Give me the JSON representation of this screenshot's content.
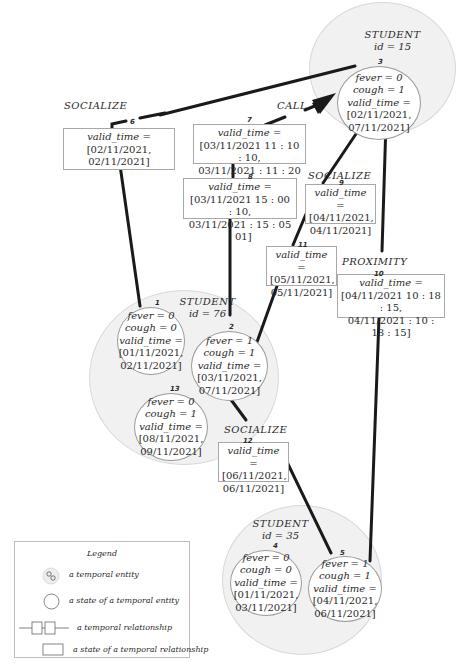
{
  "entities": [
    {
      "id": "e15",
      "type": "STUDENT",
      "id_label": "id = 15"
    },
    {
      "id": "e76",
      "type": "STUDENT",
      "id_label": "id = 76"
    },
    {
      "id": "e35",
      "type": "STUDENT",
      "id_label": "id = 35"
    }
  ],
  "states": [
    {
      "num": "3",
      "fever": "fever = 0",
      "cough": "cough = 1",
      "vt": "valid_time =",
      "from": "[02/11/2021,",
      "to": "07/11/2021]"
    },
    {
      "num": "1",
      "fever": "fever = 0",
      "cough": "cough = 0",
      "vt": "valid_time =",
      "from": "[01/11/2021,",
      "to": "02/11/2021]"
    },
    {
      "num": "2",
      "fever": "fever = 1",
      "cough": "cough = 1",
      "vt": "valid_time =",
      "from": "[03/11/2021,",
      "to": "07/11/2021]"
    },
    {
      "num": "13",
      "fever": "fever = 0",
      "cough": "cough = 1",
      "vt": "valid_time =",
      "from": "[08/11/2021,",
      "to": "09/11/2021]"
    },
    {
      "num": "4",
      "fever": "fever = 0",
      "cough": "cough = 0",
      "vt": "valid_time =",
      "from": "[01/11/2021,",
      "to": "03/11/2021]"
    },
    {
      "num": "5",
      "fever": "fever = 1",
      "cough": "cough = 1",
      "vt": "valid_time =",
      "from": "[04/11/2021,",
      "to": "06/11/2021]"
    }
  ],
  "relationships": [
    {
      "num": "6",
      "label": "SOCIALIZE",
      "vt": "valid_time =",
      "from": "[02/11/2021,",
      "to": "02/11/2021]"
    },
    {
      "num": "7",
      "label": "CALL",
      "vt": "valid_time =",
      "from": "[03/11/2021 11 : 10 : 10,",
      "to": "03/11/2021 : 11 : 20 : 01]"
    },
    {
      "num": "8",
      "label": "",
      "vt": "valid_time =",
      "from": "[03/11/2021 15 : 00 : 10,",
      "to": "03/11/2021 : 15 : 05 : 01]"
    },
    {
      "num": "9",
      "label": "SOCIALIZE",
      "vt": "valid_time =",
      "from": "[04/11/2021,",
      "to": "04/11/2021]"
    },
    {
      "num": "11",
      "label": "",
      "vt": "valid_time =",
      "from": "[05/11/2021,",
      "to": "05/11/2021]"
    },
    {
      "num": "10",
      "label": "PROXIMITY",
      "vt": "valid_time =",
      "from": "[04/11/2021 10 : 18 : 15,",
      "to": "04/11/2021 : 10 : 18 : 15]"
    },
    {
      "num": "12",
      "label": "SOCIALIZE",
      "vt": "valid_time =",
      "from": "[06/11/2021,",
      "to": "06/11/2021]"
    }
  ],
  "legend": {
    "title": "Legend",
    "items": [
      {
        "icon": "temporal-entity-icon",
        "label": "a temporal entity"
      },
      {
        "icon": "state-circle-icon",
        "label": "a state of a temporal entity"
      },
      {
        "icon": "relationship-icon",
        "label": "a temporal relationship"
      },
      {
        "icon": "state-rect-icon",
        "label": "a state of a temporal relationship"
      }
    ]
  },
  "colors": {
    "line": "#1a1a1a",
    "entity_fill": "#f1f1f1",
    "entity_border": "#d8d8d8",
    "state_border": "#9a9a9a",
    "rel_border": "#a8a8a8"
  }
}
